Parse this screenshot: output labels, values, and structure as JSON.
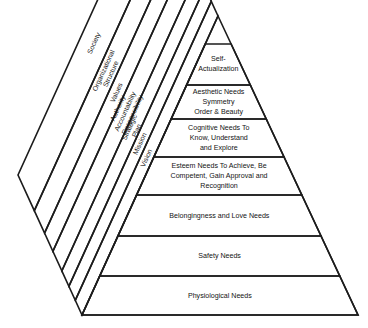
{
  "diagram": {
    "background_color": "#ffffff",
    "line_color": "#1c1c1c",
    "text_color": "#141414",
    "apex": {
      "x": 218,
      "y": 16
    },
    "base_left": {
      "x": 82,
      "y": 315
    },
    "base_right": {
      "x": 358,
      "y": 315
    },
    "outer_left_corner": {
      "x": 18,
      "y": 175
    },
    "needs_tiers": [
      {
        "id": "self-actualization",
        "lines": [
          "Self-",
          "Actualization"
        ],
        "top_y": 44,
        "bottom_y": 85,
        "label_y": 64
      },
      {
        "id": "aesthetic-needs",
        "lines": [
          "Aesthetic Needs",
          "Symmetry",
          "Order & Beauty"
        ],
        "top_y": 85,
        "bottom_y": 119,
        "label_y": 102
      },
      {
        "id": "cognitive-needs",
        "lines": [
          "Cognitive Needs To",
          "Know, Understand",
          "and Explore"
        ],
        "top_y": 119,
        "bottom_y": 157,
        "label_y": 138
      },
      {
        "id": "esteem-needs",
        "lines": [
          "Esteem Needs To Achieve, Be",
          "Competent, Gain Approval and",
          "Recognition"
        ],
        "top_y": 157,
        "bottom_y": 195,
        "label_y": 176
      },
      {
        "id": "belongingness-love-needs",
        "lines": [
          "Belongingness and Love Needs"
        ],
        "top_y": 195,
        "bottom_y": 236,
        "label_y": 216
      },
      {
        "id": "safety-needs",
        "lines": [
          "Safety Needs"
        ],
        "top_y": 236,
        "bottom_y": 276,
        "label_y": 256
      },
      {
        "id": "physiological-needs",
        "lines": [
          "Physiological Needs"
        ],
        "top_y": 276,
        "bottom_y": 315,
        "label_y": 296
      }
    ],
    "organizational_bands": [
      {
        "id": "vision",
        "lines": [
          "Vision"
        ],
        "inner_t": 0.0,
        "outer_t": 0.105
      },
      {
        "id": "mission",
        "lines": [
          "Mission"
        ],
        "inner_t": 0.105,
        "outer_t": 0.205
      },
      {
        "id": "strategic-plan",
        "lines": [
          "Strategic",
          "Plan"
        ],
        "inner_t": 0.205,
        "outer_t": 0.315
      },
      {
        "id": "authority-accountability-responsibility",
        "lines": [
          "Authority",
          "Accountability",
          "Responsibility"
        ],
        "inner_t": 0.315,
        "outer_t": 0.455
      },
      {
        "id": "values",
        "lines": [
          "Values"
        ],
        "inner_t": 0.455,
        "outer_t": 0.585
      },
      {
        "id": "organizational-structure",
        "lines": [
          "Organizational",
          "Structure"
        ],
        "inner_t": 0.585,
        "outer_t": 0.745
      },
      {
        "id": "society",
        "lines": [
          "Society"
        ],
        "inner_t": 0.745,
        "outer_t": 1.0
      }
    ]
  }
}
